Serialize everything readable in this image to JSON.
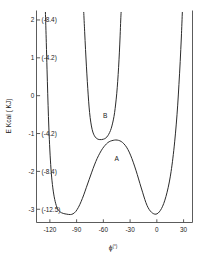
{
  "chart_data": {
    "type": "line",
    "title": "",
    "xlabel": "ϕ(°)",
    "ylabel": "E Kcal ( KJ)",
    "xlim": [
      -135,
      40
    ],
    "ylim": [
      -3.35,
      2.25
    ],
    "grid": false,
    "legend": "none",
    "xticks": [
      -120,
      -90,
      -60,
      -30,
      0,
      30
    ],
    "xticklabels": [
      "-120",
      "-90",
      "-60",
      "-30",
      "0",
      "30"
    ],
    "yticks": [
      2,
      1,
      0,
      -1,
      -2,
      -3
    ],
    "yticklabels": [
      "2",
      "1",
      "0",
      "-1",
      "-2",
      "-3"
    ],
    "ysecondary_labels": [
      "(-8.4)",
      "(-4.2)",
      "",
      "(-4.2)",
      "(-8.4)",
      "(-12.5)"
    ],
    "annotations": [
      {
        "text": "A",
        "x": -45,
        "y": -1.72
      },
      {
        "text": "B",
        "x": -58,
        "y": -0.58
      }
    ],
    "series": [
      {
        "name": "A",
        "label": "A",
        "comment": "double-well torsion potential, minima -3.1 kcal",
        "points": [
          [
            -125.0,
            2.2
          ],
          [
            -124.0,
            1.4
          ],
          [
            -123.2,
            0.7
          ],
          [
            -122.4,
            0.05
          ],
          [
            -121.6,
            -0.55
          ],
          [
            -120.6,
            -1.15
          ],
          [
            -119.4,
            -1.7
          ],
          [
            -118.0,
            -2.15
          ],
          [
            -116.2,
            -2.52
          ],
          [
            -114.0,
            -2.8
          ],
          [
            -111.5,
            -2.98
          ],
          [
            -108.5,
            -3.07
          ],
          [
            -105.0,
            -3.11
          ],
          [
            -101.0,
            -3.13
          ],
          [
            -97.0,
            -3.14
          ],
          [
            -94.0,
            -3.12
          ],
          [
            -91.0,
            -3.06
          ],
          [
            -88.0,
            -2.95
          ],
          [
            -85.0,
            -2.8
          ],
          [
            -82.0,
            -2.62
          ],
          [
            -79.0,
            -2.42
          ],
          [
            -76.0,
            -2.22
          ],
          [
            -73.0,
            -2.02
          ],
          [
            -70.0,
            -1.83
          ],
          [
            -67.0,
            -1.66
          ],
          [
            -64.0,
            -1.52
          ],
          [
            -61.0,
            -1.4
          ],
          [
            -58.0,
            -1.31
          ],
          [
            -55.0,
            -1.24
          ],
          [
            -52.0,
            -1.2
          ],
          [
            -49.0,
            -1.18
          ],
          [
            -46.0,
            -1.17
          ],
          [
            -43.0,
            -1.18
          ],
          [
            -40.0,
            -1.21
          ],
          [
            -37.0,
            -1.27
          ],
          [
            -34.0,
            -1.36
          ],
          [
            -31.0,
            -1.49
          ],
          [
            -28.0,
            -1.66
          ],
          [
            -25.0,
            -1.86
          ],
          [
            -22.0,
            -2.08
          ],
          [
            -19.0,
            -2.32
          ],
          [
            -16.0,
            -2.55
          ],
          [
            -13.5,
            -2.74
          ],
          [
            -11.0,
            -2.9
          ],
          [
            -8.5,
            -3.01
          ],
          [
            -6.0,
            -3.08
          ],
          [
            -3.5,
            -3.12
          ],
          [
            -1.0,
            -3.13
          ],
          [
            1.5,
            -3.1
          ],
          [
            4.0,
            -3.03
          ],
          [
            6.5,
            -2.92
          ],
          [
            9.0,
            -2.76
          ],
          [
            11.5,
            -2.55
          ],
          [
            14.0,
            -2.28
          ],
          [
            16.0,
            -2.0
          ],
          [
            18.0,
            -1.65
          ],
          [
            20.0,
            -1.22
          ],
          [
            21.8,
            -0.75
          ],
          [
            23.4,
            -0.25
          ],
          [
            24.8,
            0.3
          ],
          [
            26.2,
            0.9
          ],
          [
            27.5,
            1.55
          ],
          [
            28.6,
            2.2
          ]
        ]
      },
      {
        "name": "B",
        "label": "B",
        "comment": "narrow single-well potential, minimum -1.15 kcal near -60 deg",
        "points": [
          [
            -82.0,
            2.2
          ],
          [
            -81.0,
            1.7
          ],
          [
            -80.0,
            1.22
          ],
          [
            -79.0,
            0.78
          ],
          [
            -78.0,
            0.38
          ],
          [
            -77.0,
            0.02
          ],
          [
            -76.0,
            -0.3
          ],
          [
            -74.8,
            -0.58
          ],
          [
            -73.4,
            -0.8
          ],
          [
            -71.8,
            -0.96
          ],
          [
            -70.0,
            -1.06
          ],
          [
            -68.0,
            -1.12
          ],
          [
            -66.0,
            -1.15
          ],
          [
            -64.0,
            -1.16
          ],
          [
            -62.0,
            -1.16
          ],
          [
            -60.0,
            -1.15
          ],
          [
            -58.0,
            -1.13
          ],
          [
            -56.0,
            -1.09
          ],
          [
            -54.0,
            -1.02
          ],
          [
            -52.0,
            -0.92
          ],
          [
            -50.4,
            -0.8
          ],
          [
            -48.8,
            -0.64
          ],
          [
            -47.4,
            -0.45
          ],
          [
            -46.2,
            -0.22
          ],
          [
            -45.0,
            0.05
          ],
          [
            -43.9,
            0.38
          ],
          [
            -42.9,
            0.75
          ],
          [
            -42.0,
            1.15
          ],
          [
            -41.2,
            1.58
          ],
          [
            -40.5,
            2.0
          ],
          [
            -40.1,
            2.2
          ]
        ]
      }
    ]
  },
  "axis_titles": {
    "x_symbol": "ϕ",
    "x_superscript": "(°)",
    "y_full": "E Kcal ( KJ)"
  },
  "colors": {
    "curve": "#2b2b2b",
    "axis": "#4a4a4a",
    "text": "#1a1a1a",
    "background": "#ffffff"
  }
}
